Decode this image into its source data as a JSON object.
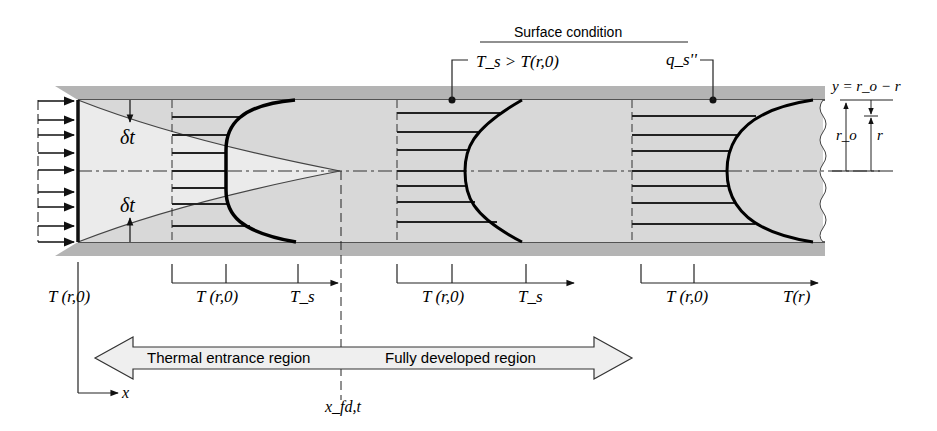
{
  "surface_condition": {
    "heading": "Surface condition",
    "left_label": "T_s > T(r,0)",
    "right_label": "q_s''"
  },
  "labels": {
    "delta_top": "δt",
    "delta_bottom": "δt",
    "y_def": "y = r_o − r",
    "r_o": "r_o",
    "r": "r",
    "x_axis": "x",
    "x_fd": "x_fd,t"
  },
  "profiles": [
    {
      "axis_labels": [
        "T (r,0)"
      ]
    },
    {
      "axis_labels": [
        "T (r,0)",
        "T_s"
      ]
    },
    {
      "axis_labels": [
        "T (r,0)",
        "T_s"
      ]
    },
    {
      "axis_labels": [
        "T (r,0)",
        "T(r)"
      ]
    }
  ],
  "regions": {
    "entrance": "Thermal entrance region",
    "developed": "Fully developed region"
  },
  "colors": {
    "wall": "#b4b4b4",
    "fluid": "#d8d8d8",
    "core": "#e9e9e9",
    "ink": "#111111"
  }
}
